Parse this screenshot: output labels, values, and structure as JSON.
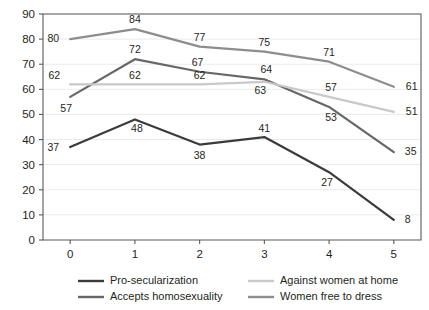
{
  "chart_data": {
    "type": "line",
    "title": "",
    "subtitle": "",
    "xlabel": "",
    "ylabel": "",
    "x": [
      0,
      1,
      2,
      3,
      4,
      5
    ],
    "categories": [
      "0",
      "1",
      "2",
      "3",
      "4",
      "5"
    ],
    "xlim": [
      -0.42,
      5.42
    ],
    "ylim": [
      0,
      90
    ],
    "y_ticks": [
      0,
      10,
      20,
      30,
      40,
      50,
      60,
      70,
      80,
      90
    ],
    "y_tick_labels": [
      "0",
      "10",
      "20",
      "30",
      "40",
      "50",
      "60",
      "70",
      "80",
      "90"
    ],
    "x_tick_labels": [
      "0",
      "1",
      "2",
      "3",
      "4",
      "5"
    ],
    "grid": "horizontal",
    "legend_position": "bottom",
    "series": [
      {
        "name": "Pro-secularization",
        "color": "#3b3b3b",
        "values": [
          37,
          48,
          38,
          41,
          27,
          8
        ],
        "labels": [
          "37",
          "48",
          "38",
          "41",
          "27",
          "8"
        ]
      },
      {
        "name": "Accepts homosexuality",
        "color": "#676767",
        "values": [
          57,
          72,
          67,
          64,
          53,
          35
        ],
        "labels": [
          "57",
          "72",
          "67",
          "64",
          "53",
          "35"
        ]
      },
      {
        "name": "Against women at home",
        "color": "#c9c9c9",
        "values": [
          62,
          62,
          62,
          63,
          57,
          51
        ],
        "labels": [
          "62",
          "62",
          "62",
          "63",
          "57",
          "51"
        ]
      },
      {
        "name": "Women free to dress",
        "color": "#8d8d8d",
        "values": [
          80,
          84,
          77,
          75,
          71,
          61
        ],
        "labels": [
          "80",
          "84",
          "77",
          "75",
          "71",
          "61"
        ]
      }
    ]
  },
  "legend": {
    "entries": [
      {
        "label": "Pro-secularization",
        "color": "#3b3b3b"
      },
      {
        "label": "Against women at home",
        "color": "#c9c9c9"
      },
      {
        "label": "Accepts homosexuality",
        "color": "#676767"
      },
      {
        "label": "Women free to dress",
        "color": "#8d8d8d"
      }
    ]
  },
  "colors": {
    "grid": "#ebebeb",
    "axis": "#58595b",
    "text": "#231f20",
    "background": "#ffffff"
  }
}
